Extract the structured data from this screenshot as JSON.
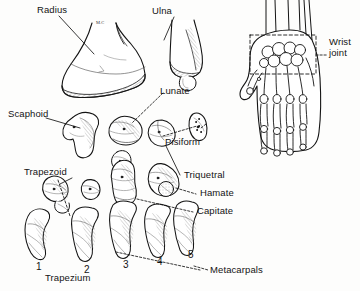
{
  "figure": {
    "background_color": "#fdfdfc",
    "ink_color": "#141414",
    "shade_color": "#8a8a8a"
  },
  "labels": {
    "radius": "Radius",
    "radius_marker": "M.C",
    "ulna": "Ulna",
    "scaphoid": "Scaphoid",
    "lunate": "Lunate",
    "pisiform": "Pisiform",
    "trapezoid": "Trapezoid",
    "triquetral": "Triquetral",
    "hamate": "Hamate",
    "capitate": "Capitate",
    "trapezium": "Trapezium",
    "metacarpals": "Metacarpals",
    "wrist_joint_line1": "Wrist",
    "wrist_joint_line2": "joint"
  },
  "metacarpal_numbers": [
    "1",
    "2",
    "3",
    "4",
    "5"
  ]
}
